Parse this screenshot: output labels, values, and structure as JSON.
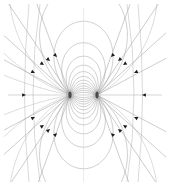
{
  "figure": {
    "background_color": "#ffffff",
    "line_color": "#9a9a9a",
    "outer_line_color": "#b4b4b4",
    "axis_color": "#a8a8a8",
    "arrow_color": "#1c1c1c",
    "width": 170,
    "height": 186
  },
  "chart_data": {
    "type": "line",
    "subtitle": "",
    "xlabel": "",
    "ylabel": "",
    "grid": false,
    "legend": "none",
    "xlim": [
      0,
      170
    ],
    "ylim": [
      0,
      186
    ],
    "center": {
      "x": 83.5,
      "y": 95
    },
    "poles": [
      {
        "name": "pole-left",
        "x": 70,
        "y": 95,
        "polarity": "north"
      },
      {
        "name": "pole-right",
        "x": 97,
        "y": 95,
        "polarity": "south"
      }
    ],
    "pole_separation": 27,
    "loop_count_per_side": 16,
    "loop_radii": [
      2.5,
      4.5,
      7,
      10,
      13.5,
      17.5,
      22,
      27,
      32.5,
      38.5,
      45,
      52,
      60,
      69,
      79,
      90
    ],
    "axis_line": {
      "x1": 8,
      "y1": 95,
      "x2": 162,
      "y2": 95
    },
    "vertical_axis_line": {
      "x1": 83.5,
      "y1": 8,
      "x2": 83.5,
      "y2": 182
    },
    "diagonal_line_angles_deg": [
      28,
      42,
      56,
      70
    ],
    "arrow_direction": "inward toward poles",
    "arrow_count": 18,
    "arrows": [
      {
        "x": 26,
        "y": 95,
        "angle": 0
      },
      {
        "x": 142,
        "y": 95,
        "angle": 180
      },
      {
        "x": 44,
        "y": 65,
        "angle": 33
      },
      {
        "x": 57,
        "y": 57,
        "angle": 46
      },
      {
        "x": 35,
        "y": 73,
        "angle": 25
      },
      {
        "x": 50,
        "y": 61,
        "angle": 40
      },
      {
        "x": 123,
        "y": 65,
        "angle": 147
      },
      {
        "x": 111,
        "y": 57,
        "angle": 134
      },
      {
        "x": 134,
        "y": 73,
        "angle": 155
      },
      {
        "x": 118,
        "y": 61,
        "angle": 140
      },
      {
        "x": 44,
        "y": 125,
        "angle": -33
      },
      {
        "x": 57,
        "y": 133,
        "angle": -46
      },
      {
        "x": 35,
        "y": 117,
        "angle": -25
      },
      {
        "x": 50,
        "y": 129,
        "angle": -40
      },
      {
        "x": 123,
        "y": 125,
        "angle": -147
      },
      {
        "x": 111,
        "y": 133,
        "angle": -134
      },
      {
        "x": 134,
        "y": 117,
        "angle": -155
      },
      {
        "x": 118,
        "y": 129,
        "angle": -140
      }
    ]
  }
}
